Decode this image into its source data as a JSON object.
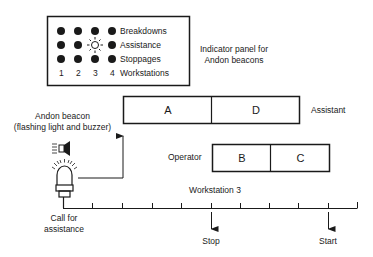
{
  "panel": {
    "rows": [
      "Breakdowns",
      "Assistance",
      "Stoppages"
    ],
    "workstation_numbers": [
      "1",
      "2",
      "3",
      "4"
    ],
    "workstations_label": "Workstations",
    "lit_indicator": {
      "row": "Assistance",
      "workstation": "3"
    },
    "caption_line1": "Indicator panel for",
    "caption_line2": "Andon beacons"
  },
  "beacon": {
    "title_line1": "Andon beacon",
    "title_line2": "(flashing light and buzzer)",
    "call_line1": "Call for",
    "call_line2": "assistance"
  },
  "assistant_row": {
    "label": "Assistant",
    "segments": [
      "A",
      "D"
    ]
  },
  "operator_row": {
    "label": "Operator",
    "segments": [
      "B",
      "C"
    ]
  },
  "timeline": {
    "label": "Workstation 3",
    "tick_count": 10,
    "events": [
      {
        "label": "Stop"
      },
      {
        "label": "Start"
      }
    ]
  },
  "colors": {
    "line": "#1a1a1a",
    "background": "#ffffff"
  }
}
